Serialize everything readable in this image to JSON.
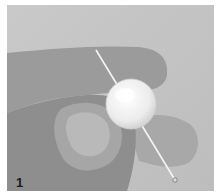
{
  "figure": {
    "step_number": "1",
    "colors": {
      "background": "#c4c4c4",
      "skin_dark": "#8a8a8a",
      "skin_mid": "#a3a3a3",
      "skin_light": "#b8b8b8",
      "bead": "#f2f2f2",
      "pin": "#f5f5f5",
      "label": "#1a1a1a"
    }
  }
}
